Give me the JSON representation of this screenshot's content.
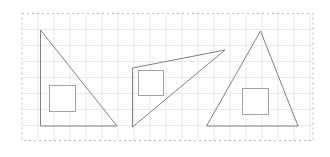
{
  "figure": {
    "canvas": {
      "width": 330,
      "height": 157,
      "background": "#ffffff"
    },
    "frame": {
      "x": 22,
      "y": 13.5,
      "width": 291,
      "height": 127,
      "stroke": "#b9b9b9",
      "dash": "2,3"
    },
    "grid": {
      "spacing": 16,
      "stroke": "#e9e9e9"
    },
    "styles": {
      "triangle_stroke": "#818181",
      "square_stroke": "#a3a3a3",
      "square_fill": "#ffffff"
    },
    "shapes": [
      {
        "name": "left-right-triangle",
        "kind": "triangle",
        "points": "40.5,30 40.5,126 117,126"
      },
      {
        "name": "left-inner-square",
        "kind": "square",
        "x": 49.5,
        "y": 85.5,
        "size": 26
      },
      {
        "name": "middle-scalene-triangle",
        "kind": "triangle",
        "points": "132.5,68 225,50 132.5,127"
      },
      {
        "name": "middle-inner-square",
        "kind": "square",
        "x": 138.5,
        "y": 70.5,
        "size": 25
      },
      {
        "name": "right-isosceles-triangle",
        "kind": "triangle",
        "points": "260.5,31 206.5,126 298,126"
      },
      {
        "name": "right-inner-square",
        "kind": "square",
        "x": 242.5,
        "y": 88.5,
        "size": 26
      }
    ]
  }
}
